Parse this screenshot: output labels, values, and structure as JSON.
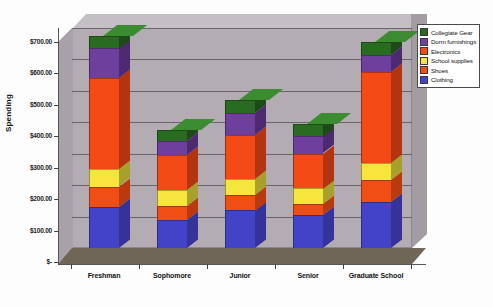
{
  "chart_data": {
    "type": "bar",
    "subtype": "stacked-column-3d",
    "title": "",
    "xlabel": "",
    "ylabel": "Spending",
    "categories": [
      "Freshman",
      "Sophomore",
      "Junior",
      "Senior",
      "Graduate School"
    ],
    "ylim": [
      0,
      700
    ],
    "ytick_values": [
      0,
      100,
      200,
      300,
      400,
      500,
      600,
      700
    ],
    "ytick_labels": [
      "$-",
      "$100.00",
      "$200.00",
      "$300.00",
      "$400.00",
      "$500.00",
      "$600.00",
      "$700.00"
    ],
    "grid": true,
    "legend_position": "top-right",
    "series": [
      {
        "name": "Clothing",
        "color": "#4343c8",
        "side_color": "#333399",
        "cap_color": "#5b5bd8",
        "values": [
          130,
          90,
          120,
          105,
          145
        ]
      },
      {
        "name": "Shoes",
        "color": "#f04e14",
        "side_color": "#b83a0e",
        "cap_color": "#f76a30",
        "values": [
          65,
          45,
          50,
          35,
          70
        ]
      },
      {
        "name": "School supplies",
        "color": "#f5e53c",
        "side_color": "#a8a02a",
        "cap_color": "#fbf06a",
        "values": [
          55,
          50,
          50,
          50,
          55
        ]
      },
      {
        "name": "Electronics",
        "color": "#f44b16",
        "side_color": "#b23510",
        "cap_color": "#f96a35",
        "values": [
          290,
          110,
          140,
          110,
          290
        ]
      },
      {
        "name": "Dorm furnishings",
        "color": "#6f3f9e",
        "side_color": "#4d2a70",
        "cap_color": "#8453b5",
        "values": [
          95,
          45,
          70,
          55,
          55
        ]
      },
      {
        "name": "Collegiate Gear",
        "color": "#2a6b22",
        "side_color": "#1d4a18",
        "cap_color": "#3b8c30",
        "values": [
          40,
          35,
          40,
          40,
          40
        ]
      }
    ],
    "totals": [
      675,
      375,
      470,
      395,
      655
    ]
  },
  "legend": {
    "items": [
      {
        "label": "Collegiate Gear"
      },
      {
        "label": "Dorm furnishings"
      },
      {
        "label": "Electronics"
      },
      {
        "label": "School supplies"
      },
      {
        "label": "Shoes"
      },
      {
        "label": "Clothing"
      }
    ]
  }
}
